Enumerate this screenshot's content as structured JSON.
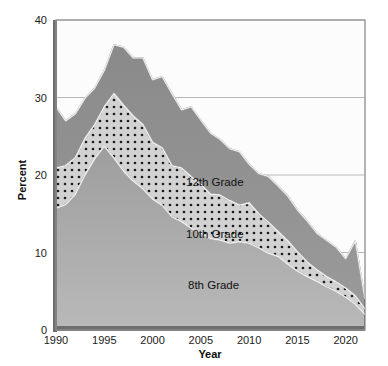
{
  "chart_data": {
    "type": "area",
    "stacked": false,
    "title": "",
    "xlabel": "Year",
    "ylabel": "Percent",
    "xlim": [
      1990,
      2022
    ],
    "ylim": [
      0,
      40
    ],
    "ytick_labels": [
      "0",
      "10",
      "20",
      "30",
      "40"
    ],
    "yticks": [
      0,
      10,
      20,
      30,
      40
    ],
    "xtick_labels": [
      "1990",
      "1995",
      "2000",
      "2005",
      "2010",
      "2015",
      "2020"
    ],
    "xticks": [
      1990,
      1995,
      2000,
      2005,
      2010,
      2015,
      2020
    ],
    "grid": "horizontal",
    "legend_position": "inline-annotations",
    "x": [
      1990,
      1991,
      1992,
      1993,
      1994,
      1995,
      1996,
      1997,
      1998,
      1999,
      2000,
      2001,
      2002,
      2003,
      2004,
      2005,
      2006,
      2007,
      2008,
      2009,
      2010,
      2011,
      2012,
      2013,
      2014,
      2015,
      2016,
      2017,
      2018,
      2019,
      2020,
      2021,
      2022
    ],
    "series": [
      {
        "name": "12th Grade",
        "label": "12th Grade",
        "fill": "#8c8c8c",
        "pattern": "solid",
        "values": [
          28.8,
          27.0,
          27.9,
          29.9,
          31.2,
          33.5,
          36.8,
          36.5,
          35.1,
          35.1,
          32.3,
          32.7,
          30.5,
          28.4,
          28.8,
          27.1,
          25.4,
          24.6,
          23.4,
          23.0,
          21.4,
          20.2,
          19.8,
          18.6,
          17.3,
          15.5,
          14.1,
          12.5,
          11.6,
          10.7,
          9.2,
          11.5,
          4.0
        ]
      },
      {
        "name": "10th Grade",
        "label": "10th Grade",
        "fill": "#c8c8c8",
        "pattern": "dotted",
        "values": [
          20.9,
          21.2,
          22.2,
          24.7,
          26.5,
          28.8,
          30.5,
          29.0,
          27.6,
          26.5,
          24.2,
          23.5,
          21.2,
          20.9,
          19.8,
          18.8,
          17.5,
          17.4,
          16.7,
          16.1,
          16.4,
          15.0,
          13.9,
          12.7,
          11.5,
          10.1,
          8.8,
          7.8,
          6.9,
          6.2,
          5.4,
          4.4,
          2.7
        ]
      },
      {
        "name": "8th Grade",
        "label": "8th Grade",
        "fill": "#a8a8a8",
        "pattern": "solid",
        "values": [
          15.7,
          16.2,
          17.5,
          20.0,
          22.1,
          23.7,
          22.2,
          20.5,
          19.2,
          18.2,
          16.9,
          16.1,
          14.6,
          14.0,
          13.1,
          12.5,
          11.8,
          11.6,
          11.2,
          11.4,
          11.2,
          10.6,
          9.9,
          9.5,
          8.5,
          7.6,
          6.9,
          6.3,
          5.6,
          5.0,
          4.2,
          3.3,
          2.0
        ]
      }
    ]
  },
  "axes": {
    "y_title": "Percent",
    "x_title": "Year"
  },
  "colors": {
    "band_12th": "#8c8c8c",
    "band_10th": "#c8c8c8",
    "band_8th": "#a8a8a8",
    "axis": "#5a5a5a",
    "grid": "#b8b8b8",
    "outline": "#2b2b2b",
    "background": "#ffffff"
  }
}
